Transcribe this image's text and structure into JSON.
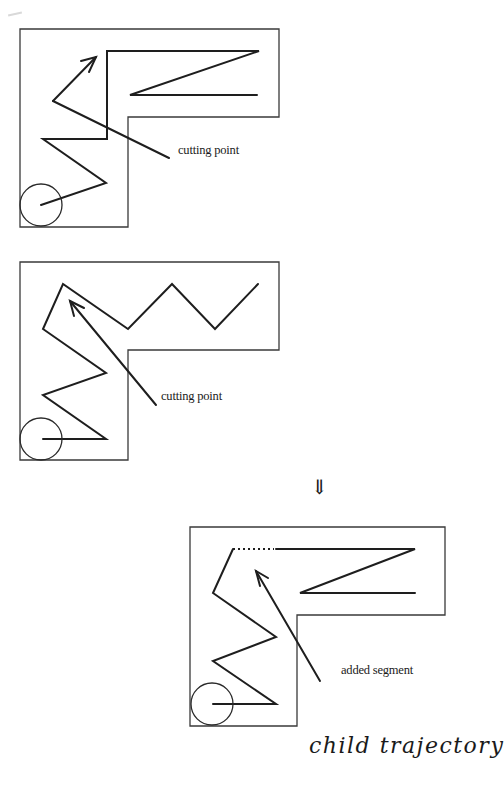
{
  "panels": [
    {
      "id": "panel-1",
      "frame": "20,29 279,29 279,117 128,117 128,227 20,227",
      "trajectory": "41,205 106,183 43,139 107,139 107,51 259,51 130,95 257,95",
      "pointer": {
        "from": "169,158",
        "to": "53,101",
        "extra": "53,101 96,57",
        "arrowhead": "81,61 96,57 89,72"
      },
      "robot": {
        "cx": 41,
        "cy": 205,
        "r": 21
      },
      "label": {
        "text": "cutting point",
        "x": 178,
        "y": 150
      }
    },
    {
      "id": "panel-2",
      "frame": "20,262 279,262 279,350 128,350 128,460 20,460",
      "trajectory": "43,439 106,439 43,395 106,373 43,329 63,284 128,329 172,284 215,329 258,284",
      "pointer": {
        "from": "156,405",
        "to": "70,301",
        "arrowhead": "74,316 70,301 84,308"
      },
      "robot": {
        "cx": 41,
        "cy": 439,
        "r": 21
      },
      "label": {
        "text": "cutting point",
        "x": 161,
        "y": 396
      }
    },
    {
      "id": "panel-3",
      "frame": "190,527 445,527 445,615 297,615 297,726 190,726",
      "trajectory": "213,704 276,704 213,661 276,637 213,593 233,549",
      "trajectory_tail": "276,549 415,549 300,593 415,593",
      "dotted_segment": "233,549 274,549",
      "pointer": {
        "from": "320,681",
        "to": "256,571",
        "arrowhead": "260,586 256,571 268,578"
      },
      "robot": {
        "cx": 212,
        "cy": 704,
        "r": 21
      },
      "label": {
        "text": "added segment",
        "x": 341,
        "y": 670
      }
    }
  ],
  "transition_arrow": {
    "glyph": "⇓",
    "x": 312,
    "y": 477
  },
  "caption": {
    "text": "child trajectory",
    "x": 311,
    "y": 737
  },
  "colors": {
    "ink": "#1e1e1e",
    "frame": "#3a3a3a",
    "background": "#ffffff"
  }
}
